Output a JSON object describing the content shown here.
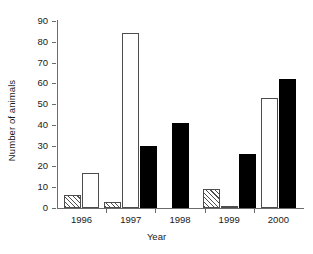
{
  "chart_data": {
    "type": "bar",
    "title": "",
    "xlabel": "Year",
    "ylabel": "Number of animals",
    "categories": [
      "1996",
      "1997",
      "1998",
      "1999",
      "2000"
    ],
    "ylim": [
      0,
      90
    ],
    "yticks": [
      0,
      10,
      20,
      30,
      40,
      50,
      60,
      70,
      80,
      90
    ],
    "grid": false,
    "legend": "none",
    "series": [
      {
        "name": "hatched",
        "fill": "hatched",
        "values": [
          6.5,
          3,
          0,
          9,
          0
        ]
      },
      {
        "name": "open",
        "fill": "white",
        "values": [
          17,
          84,
          0,
          1,
          53
        ]
      },
      {
        "name": "solid",
        "fill": "black",
        "values": [
          0,
          30,
          41,
          26,
          62
        ]
      }
    ]
  },
  "axis": {
    "y_label": "Number of animals",
    "x_label": "Year",
    "y_ticks": [
      "90",
      "80",
      "70",
      "60",
      "50",
      "40",
      "30",
      "20",
      "10",
      "0"
    ],
    "x_ticks": [
      "1996",
      "1997",
      "1998",
      "1999",
      "2000"
    ]
  }
}
